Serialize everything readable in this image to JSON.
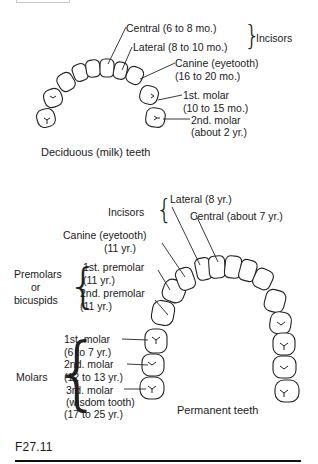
{
  "figure": {
    "number": "F27.11",
    "deciduous": {
      "caption": "Deciduous (milk) teeth",
      "group_incisors": "Incisors",
      "labels": {
        "central": "Central (6 to 8 mo.)",
        "lateral": "Lateral (8 to 10 mo.)",
        "canine_1": "Canine (eyetooth)",
        "canine_2": "(16 to 20 mo.)",
        "molar1_1": "1st. molar",
        "molar1_2": "(10 to 15 mo.)",
        "molar2_1": "2nd. molar",
        "molar2_2": "(about 2 yr.)"
      }
    },
    "permanent": {
      "caption": "Permanent teeth",
      "group_incisors": "Incisors",
      "group_premolars_1": "Premolars",
      "group_premolars_2": "or",
      "group_premolars_3": "bicuspids",
      "group_molars": "Molars",
      "labels": {
        "lateral": "Lateral (8 yr.)",
        "central": "Central (about 7 yr.)",
        "canine_1": "Canine (eyetooth)",
        "canine_2": "(11 yr.)",
        "premolar1_1": "1st. premolar",
        "premolar1_2": "(11 yr.)",
        "premolar2_1": "2nd. premolar",
        "premolar2_2": "(11 yr.)",
        "molar1_1": "1st. molar",
        "molar1_2": "(6 to 7 yr.)",
        "molar2_1": "2nd. molar",
        "molar2_2": "(12 to 13 yr.)",
        "molar3_1": "3rd. molar",
        "molar3_2": "(wisdom tooth)",
        "molar3_3": "(17 to 25 yr.)"
      }
    },
    "braces": {
      "curly_left": "{",
      "curly_right": "}"
    }
  }
}
